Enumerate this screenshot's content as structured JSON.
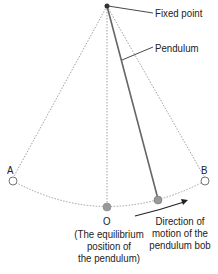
{
  "diagram": {
    "labels": {
      "fixed_point": "Fixed point",
      "pendulum": "Pendulum",
      "point_a": "A",
      "point_b": "B",
      "point_o": "O",
      "equilibrium_line1": "(The equilibrium",
      "equilibrium_line2": "position of",
      "equilibrium_line3": "the pendulum)",
      "direction_line1": "Direction of",
      "direction_line2": "motion of the",
      "direction_line3": "pendulum bob"
    },
    "colors": {
      "line": "#555555",
      "dotted": "#888888",
      "bob_fill": "#999999",
      "text": "#222222"
    }
  }
}
